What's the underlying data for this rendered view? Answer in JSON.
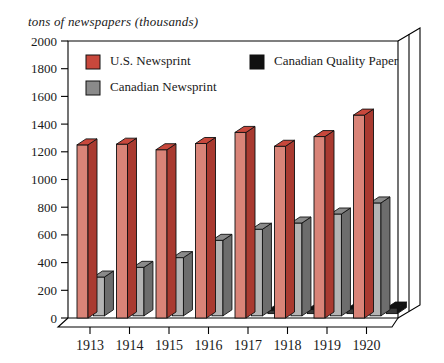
{
  "chart_data": {
    "type": "bar",
    "title": "tons of newspapers (thousands)",
    "xlabel": "",
    "ylabel": "tons of newspapers (thousands)",
    "categories": [
      "1913",
      "1914",
      "1915",
      "1916",
      "1917",
      "1918",
      "1919",
      "1920"
    ],
    "series": [
      {
        "name": "U.S. Newsprint",
        "color": "#c8483c",
        "values": [
          1250,
          1255,
          1215,
          1260,
          1340,
          1240,
          1310,
          1465
        ]
      },
      {
        "name": "Canadian Newsprint",
        "color": "#8a8a8a",
        "values": [
          280,
          350,
          420,
          545,
          625,
          670,
          735,
          815
        ]
      },
      {
        "name": "Canadian Quality Paper",
        "color": "#111111",
        "values": [
          0,
          0,
          0,
          0,
          25,
          30,
          35,
          40
        ]
      }
    ],
    "ylim": [
      0,
      2000
    ],
    "ytick_step": 200,
    "yticks": [
      "0",
      "200",
      "400",
      "600",
      "800",
      "1000",
      "1200",
      "1400",
      "1600",
      "1800",
      "2000"
    ],
    "grid": false,
    "legend_position": "inside-top",
    "style": "3d-bar"
  },
  "colors": {
    "us_newsprint": "#c8483c",
    "us_newsprint_light": "#d98478",
    "us_newsprint_dark": "#a93a30",
    "canadian_newsprint": "#8a8a8a",
    "canadian_newsprint_light": "#b4b4b4",
    "canadian_newsprint_dark": "#6d6d6d",
    "canadian_quality_paper": "#111111",
    "canadian_quality_paper_light": "#3a3a3a",
    "axis": "#000000",
    "background": "#ffffff"
  }
}
